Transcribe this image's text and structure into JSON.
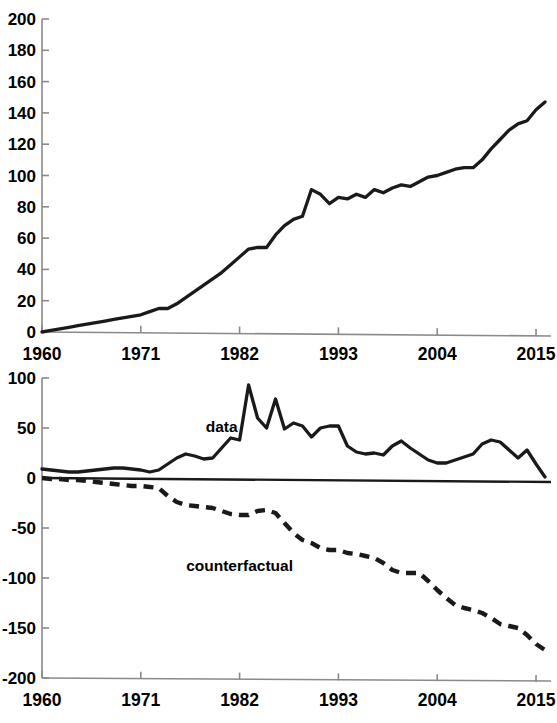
{
  "figure": {
    "background_color": "#ffffff",
    "line_color": "#1a1a1a",
    "axis_color": "#8a8a8a"
  },
  "chart_data": [
    {
      "id": "top",
      "type": "line",
      "title": "",
      "subtitle": "",
      "xlabel": "",
      "ylabel": "",
      "grid": false,
      "legend_position": "none",
      "xlim": [
        1960,
        2016
      ],
      "ylim": [
        0,
        200
      ],
      "xticks": [
        1960,
        1971,
        1982,
        1993,
        2004,
        2015
      ],
      "xticklabels": [
        "1960",
        "1971",
        "1982",
        "1993",
        "2004",
        "2015"
      ],
      "yticks": [
        0,
        20,
        40,
        60,
        80,
        100,
        120,
        140,
        160,
        180,
        200
      ],
      "yticklabels": [
        "0",
        "20",
        "40",
        "60",
        "80",
        "100",
        "120",
        "140",
        "160",
        "180",
        "200"
      ],
      "series": [
        {
          "name": "cumulative",
          "style": "solid",
          "x": [
            1960,
            1961,
            1962,
            1963,
            1964,
            1965,
            1966,
            1967,
            1968,
            1969,
            1970,
            1971,
            1972,
            1973,
            1974,
            1975,
            1976,
            1977,
            1978,
            1979,
            1980,
            1981,
            1982,
            1983,
            1984,
            1985,
            1986,
            1987,
            1988,
            1989,
            1990,
            1991,
            1992,
            1993,
            1994,
            1995,
            1996,
            1997,
            1998,
            1999,
            2000,
            2001,
            2002,
            2003,
            2004,
            2005,
            2006,
            2007,
            2008,
            2009,
            2010,
            2011,
            2012,
            2013,
            2014,
            2015,
            2016
          ],
          "y": [
            0,
            1,
            2,
            3,
            4,
            5,
            6,
            7,
            8,
            9,
            10,
            11,
            13,
            15,
            15,
            18,
            22,
            26,
            30,
            34,
            38,
            43,
            48,
            53,
            54,
            54,
            62,
            68,
            72,
            74,
            91,
            88,
            82,
            86,
            85,
            88,
            86,
            91,
            89,
            92,
            94,
            93,
            96,
            99,
            100,
            102,
            104,
            105,
            105,
            110,
            117,
            123,
            129,
            133,
            135,
            142,
            147
          ]
        }
      ]
    },
    {
      "id": "bottom",
      "type": "line",
      "title": "",
      "subtitle": "",
      "xlabel": "",
      "ylabel": "",
      "grid": false,
      "legend_position": "inline-annotation",
      "xlim": [
        1960,
        2016
      ],
      "ylim": [
        -200,
        100
      ],
      "xticks": [
        1960,
        1971,
        1982,
        1993,
        2004,
        2015
      ],
      "xticklabels": [
        "1960",
        "1971",
        "1982",
        "1993",
        "2004",
        "2015"
      ],
      "yticks": [
        -200,
        -150,
        -100,
        -50,
        0,
        50,
        100
      ],
      "yticklabels": [
        "-200",
        "-150",
        "-100",
        "-50",
        "0",
        "50",
        "100"
      ],
      "annotations": [
        {
          "text": "data",
          "x": 1980,
          "y": 46
        },
        {
          "text": "counterfactual",
          "x": 1982,
          "y": -93
        }
      ],
      "series": [
        {
          "name": "data",
          "style": "solid",
          "x": [
            1960,
            1961,
            1962,
            1963,
            1964,
            1965,
            1966,
            1967,
            1968,
            1969,
            1970,
            1971,
            1972,
            1973,
            1974,
            1975,
            1976,
            1977,
            1978,
            1979,
            1980,
            1981,
            1982,
            1983,
            1984,
            1985,
            1986,
            1987,
            1988,
            1989,
            1990,
            1991,
            1992,
            1993,
            1994,
            1995,
            1996,
            1997,
            1998,
            1999,
            2000,
            2001,
            2002,
            2003,
            2004,
            2005,
            2006,
            2007,
            2008,
            2009,
            2010,
            2011,
            2012,
            2013,
            2014,
            2015,
            2016
          ],
          "y": [
            9,
            8,
            7,
            6,
            6,
            7,
            8,
            9,
            10,
            10,
            9,
            8,
            6,
            8,
            14,
            20,
            24,
            22,
            19,
            20,
            30,
            40,
            38,
            93,
            60,
            50,
            79,
            49,
            55,
            52,
            41,
            50,
            52,
            52,
            32,
            26,
            24,
            25,
            23,
            32,
            37,
            30,
            24,
            18,
            15,
            15,
            18,
            21,
            24,
            34,
            38,
            36,
            28,
            20,
            28,
            14,
            1
          ]
        },
        {
          "name": "counterfactual",
          "style": "dashed",
          "x": [
            1960,
            1961,
            1962,
            1963,
            1964,
            1965,
            1966,
            1967,
            1968,
            1969,
            1970,
            1971,
            1972,
            1973,
            1974,
            1975,
            1976,
            1977,
            1978,
            1979,
            1980,
            1981,
            1982,
            1983,
            1984,
            1985,
            1986,
            1987,
            1988,
            1989,
            1990,
            1991,
            1992,
            1993,
            1994,
            1995,
            1996,
            1997,
            1998,
            1999,
            2000,
            2001,
            2002,
            2003,
            2004,
            2005,
            2006,
            2007,
            2008,
            2009,
            2010,
            2011,
            2012,
            2013,
            2014,
            2015,
            2016
          ],
          "y": [
            0,
            -1,
            -1,
            -2,
            -2,
            -3,
            -4,
            -5,
            -6,
            -7,
            -8,
            -8,
            -9,
            -10,
            -18,
            -24,
            -27,
            -28,
            -29,
            -30,
            -33,
            -36,
            -37,
            -37,
            -33,
            -32,
            -35,
            -45,
            -55,
            -62,
            -65,
            -70,
            -72,
            -72,
            -75,
            -76,
            -78,
            -80,
            -85,
            -92,
            -95,
            -95,
            -95,
            -103,
            -112,
            -120,
            -127,
            -130,
            -132,
            -135,
            -140,
            -146,
            -148,
            -150,
            -157,
            -166,
            -172
          ]
        }
      ]
    }
  ]
}
